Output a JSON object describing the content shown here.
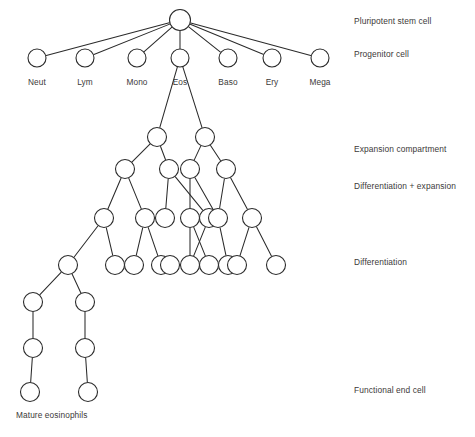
{
  "figure": {
    "background_color": "#ffffff",
    "node_stroke_color": "#2b2b2b",
    "node_fill_color": "#ffffff",
    "edge_color": "#2b2b2b",
    "text_color": "#3c3a39"
  },
  "lineage_labels": [
    {
      "id": "neut",
      "text": "Neut",
      "x": 37,
      "y": 85
    },
    {
      "id": "lym",
      "text": "Lym",
      "x": 85,
      "y": 85
    },
    {
      "id": "mono",
      "text": "Mono",
      "x": 137,
      "y": 85
    },
    {
      "id": "eos",
      "text": "Eos",
      "x": 180,
      "y": 85
    },
    {
      "id": "baso",
      "text": "Baso",
      "x": 228,
      "y": 85
    },
    {
      "id": "ery",
      "text": "Ery",
      "x": 272,
      "y": 85
    },
    {
      "id": "mega",
      "text": "Mega",
      "x": 320,
      "y": 85
    }
  ],
  "stage_labels": [
    {
      "id": "pluripotent-stem-cell",
      "text": "Pluripotent stem cell",
      "x": 354,
      "y": 24
    },
    {
      "id": "progenitor-cell",
      "text": "Progenitor cell",
      "x": 354,
      "y": 57
    },
    {
      "id": "expansion-compartment",
      "text": "Expansion compartment",
      "x": 354,
      "y": 152
    },
    {
      "id": "differentiation-plus-expansion",
      "text": "Differentiation + expansion",
      "x": 354,
      "y": 189
    },
    {
      "id": "differentiation",
      "text": "Differentiation",
      "x": 354,
      "y": 265
    },
    {
      "id": "functional-end-cell",
      "text": "Functional end cell",
      "x": 354,
      "y": 393
    }
  ],
  "terminal_label": {
    "id": "mature-eosinophils",
    "text": "Mature eosinophils",
    "x": 16,
    "y": 418
  },
  "chart_data": {
    "type": "diagram",
    "diagram_kind": "tree",
    "nodes": [
      {
        "id": "stem",
        "x": 180,
        "y": 20,
        "r": 10.5,
        "row": "stem"
      },
      {
        "id": "p-neut",
        "x": 37,
        "y": 58,
        "r": 9,
        "row": "progenitor"
      },
      {
        "id": "p-lym",
        "x": 85,
        "y": 58,
        "r": 9,
        "row": "progenitor"
      },
      {
        "id": "p-mono",
        "x": 137,
        "y": 58,
        "r": 9,
        "row": "progenitor"
      },
      {
        "id": "p-eos",
        "x": 180,
        "y": 58,
        "r": 9,
        "row": "progenitor"
      },
      {
        "id": "p-baso",
        "x": 228,
        "y": 58,
        "r": 9,
        "row": "progenitor"
      },
      {
        "id": "p-ery",
        "x": 272,
        "y": 58,
        "r": 9,
        "row": "progenitor"
      },
      {
        "id": "p-mega",
        "x": 320,
        "y": 58,
        "r": 9,
        "row": "progenitor"
      },
      {
        "id": "e1-a",
        "x": 157,
        "y": 137,
        "r": 9.5,
        "row": "expansion-1"
      },
      {
        "id": "e1-b",
        "x": 205,
        "y": 137,
        "r": 9.5,
        "row": "expansion-1"
      },
      {
        "id": "e2-a",
        "x": 125,
        "y": 169,
        "r": 9.5,
        "row": "expansion-2"
      },
      {
        "id": "e2-b",
        "x": 169,
        "y": 169,
        "r": 9.5,
        "row": "expansion-2"
      },
      {
        "id": "e2-c",
        "x": 190,
        "y": 169,
        "r": 9.5,
        "row": "expansion-2"
      },
      {
        "id": "e2-d",
        "x": 226,
        "y": 169,
        "r": 9.5,
        "row": "expansion-2"
      },
      {
        "id": "e3-a",
        "x": 104,
        "y": 218,
        "r": 9.5,
        "row": "expansion-3"
      },
      {
        "id": "e3-b",
        "x": 145,
        "y": 218,
        "r": 9.5,
        "row": "expansion-3"
      },
      {
        "id": "e3-c",
        "x": 165,
        "y": 218,
        "r": 9.5,
        "row": "expansion-3"
      },
      {
        "id": "e3-d",
        "x": 190,
        "y": 218,
        "r": 9.5,
        "row": "expansion-3"
      },
      {
        "id": "e3-e",
        "x": 209,
        "y": 218,
        "r": 9.5,
        "row": "expansion-3"
      },
      {
        "id": "e3-f",
        "x": 218,
        "y": 218,
        "r": 9.5,
        "row": "expansion-3"
      },
      {
        "id": "e3-g",
        "x": 252,
        "y": 218,
        "r": 9.5,
        "row": "expansion-3"
      },
      {
        "id": "e4-a",
        "x": 68,
        "y": 265,
        "r": 9.5,
        "row": "expansion-4"
      },
      {
        "id": "e4-b",
        "x": 115,
        "y": 265,
        "r": 9.5,
        "row": "expansion-4"
      },
      {
        "id": "e4-c",
        "x": 134,
        "y": 265,
        "r": 9.5,
        "row": "expansion-4"
      },
      {
        "id": "e4-d",
        "x": 161,
        "y": 265,
        "r": 9.5,
        "row": "expansion-4"
      },
      {
        "id": "e4-e",
        "x": 170,
        "y": 265,
        "r": 9.5,
        "row": "expansion-4"
      },
      {
        "id": "e4-f",
        "x": 190,
        "y": 265,
        "r": 9.5,
        "row": "expansion-4"
      },
      {
        "id": "e4-g",
        "x": 209,
        "y": 265,
        "r": 9.5,
        "row": "expansion-4"
      },
      {
        "id": "e4-h",
        "x": 228,
        "y": 265,
        "r": 9.5,
        "row": "expansion-4"
      },
      {
        "id": "e4-i",
        "x": 237,
        "y": 265,
        "r": 9.5,
        "row": "expansion-4"
      },
      {
        "id": "e4-j",
        "x": 276,
        "y": 265,
        "r": 9.5,
        "row": "expansion-4"
      },
      {
        "id": "d1-a",
        "x": 33,
        "y": 302,
        "r": 9.5,
        "row": "differentiation-1"
      },
      {
        "id": "d1-b",
        "x": 85,
        "y": 302,
        "r": 9.5,
        "row": "differentiation-1"
      },
      {
        "id": "d2-a",
        "x": 33,
        "y": 348,
        "r": 9.5,
        "row": "differentiation-2"
      },
      {
        "id": "d2-b",
        "x": 85,
        "y": 348,
        "r": 9.5,
        "row": "differentiation-2"
      },
      {
        "id": "end-a",
        "x": 30,
        "y": 392,
        "r": 9.5,
        "row": "functional-end"
      },
      {
        "id": "end-b",
        "x": 88,
        "y": 392,
        "r": 9.5,
        "row": "functional-end"
      }
    ],
    "edges": [
      {
        "from": "stem",
        "to": "p-neut"
      },
      {
        "from": "stem",
        "to": "p-lym"
      },
      {
        "from": "stem",
        "to": "p-mono"
      },
      {
        "from": "stem",
        "to": "p-eos"
      },
      {
        "from": "stem",
        "to": "p-baso"
      },
      {
        "from": "stem",
        "to": "p-ery"
      },
      {
        "from": "stem",
        "to": "p-mega"
      },
      {
        "from": "p-eos",
        "to": "e1-a"
      },
      {
        "from": "p-eos",
        "to": "e1-b"
      },
      {
        "from": "e1-a",
        "to": "e2-a"
      },
      {
        "from": "e1-a",
        "to": "e2-b"
      },
      {
        "from": "e1-b",
        "to": "e2-c"
      },
      {
        "from": "e1-b",
        "to": "e2-d"
      },
      {
        "from": "e2-a",
        "to": "e3-a"
      },
      {
        "from": "e2-a",
        "to": "e3-b"
      },
      {
        "from": "e2-b",
        "to": "e3-c"
      },
      {
        "from": "e2-b",
        "to": "e3-e"
      },
      {
        "from": "e2-c",
        "to": "e3-d"
      },
      {
        "from": "e2-c",
        "to": "e3-f"
      },
      {
        "from": "e2-d",
        "to": "e3-f"
      },
      {
        "from": "e2-d",
        "to": "e3-g"
      },
      {
        "from": "e3-a",
        "to": "e4-a"
      },
      {
        "from": "e3-a",
        "to": "e4-b"
      },
      {
        "from": "e3-b",
        "to": "e4-c"
      },
      {
        "from": "e3-b",
        "to": "e4-d"
      },
      {
        "from": "e3-d",
        "to": "e4-f"
      },
      {
        "from": "e3-d",
        "to": "e4-g"
      },
      {
        "from": "e3-e",
        "to": "e4-f"
      },
      {
        "from": "e3-f",
        "to": "e4-h"
      },
      {
        "from": "e3-g",
        "to": "e4-i"
      },
      {
        "from": "e3-g",
        "to": "e4-j"
      },
      {
        "from": "e4-a",
        "to": "d1-a"
      },
      {
        "from": "e4-a",
        "to": "d1-b"
      },
      {
        "from": "d1-a",
        "to": "d2-a"
      },
      {
        "from": "d1-b",
        "to": "d2-b"
      },
      {
        "from": "d2-a",
        "to": "end-a"
      },
      {
        "from": "d2-b",
        "to": "end-b"
      }
    ]
  }
}
